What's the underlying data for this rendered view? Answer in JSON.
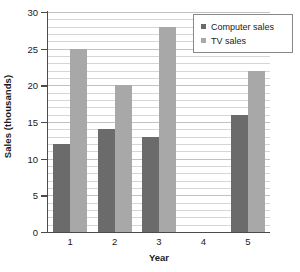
{
  "chart_data": {
    "type": "bar",
    "title": "",
    "xlabel": "Year",
    "ylabel": "Sales (thousands)",
    "categories": [
      "1",
      "2",
      "3",
      "4",
      "5"
    ],
    "series": [
      {
        "name": "Computer sales",
        "color": "#6b6b6b",
        "values": [
          12,
          14,
          13,
          0,
          16
        ]
      },
      {
        "name": "TV sales",
        "color": "#a8a8a8",
        "values": [
          25,
          20,
          28,
          0,
          22
        ]
      }
    ],
    "ylim": [
      0,
      30
    ],
    "y_major_ticks": [
      0,
      5,
      10,
      15,
      20,
      25,
      30
    ],
    "y_major_tick_labels": [
      "0",
      "5",
      "10",
      "15",
      "20",
      "25",
      "30"
    ],
    "y_minor_tick_step": 1,
    "grid": true,
    "grid_axis": "y",
    "legend_position": "top-right",
    "background_color": "#ffffff",
    "axis_color": "#4a4a4a",
    "gridline_color": "#d6d6d6"
  }
}
